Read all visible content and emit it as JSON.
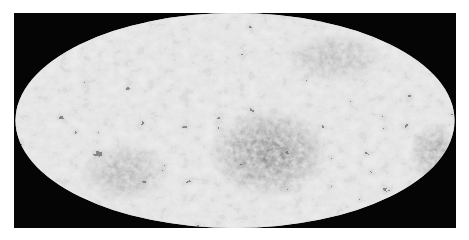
{
  "figure": {
    "type": "all-sky map (Mollweide-style elliptical projection)",
    "background_color": "#050505",
    "map_base_color": "#c4c4c4",
    "map_dark_color": "#1a1a1a",
    "page_background": "#ffffff"
  },
  "caption": {
    "text": "",
    "note": "caption line cropped at bottom edge; glyphs only partially visible"
  }
}
